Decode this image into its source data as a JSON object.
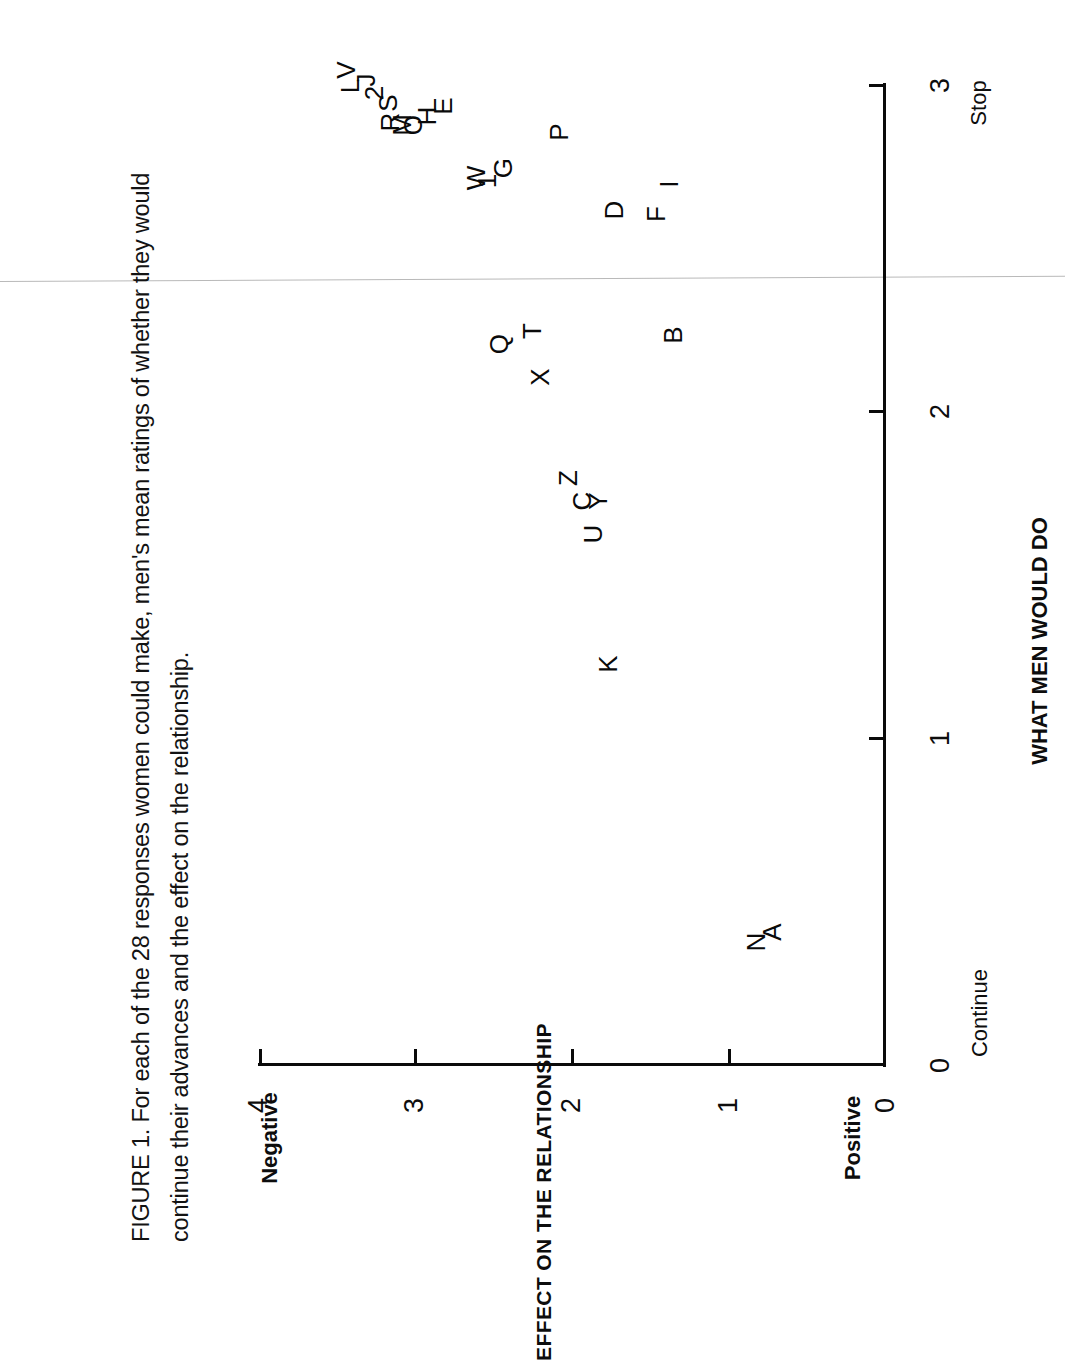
{
  "figure": {
    "caption_line1": "FIGURE 1. For each of the 28 responses women could make, men's mean ratings of whether they would",
    "caption_line2": "continue their advances and the effect on the relationship."
  },
  "chart_data": {
    "type": "scatter",
    "title": "FIGURE 1. For each of the 28 responses women could make, men's mean ratings of whether they would continue their advances and the effect on the relationship.",
    "orientation": "rotated-90-ccw",
    "xlabel": "WHAT MEN WOULD DO",
    "ylabel": "EFFECT ON THE RELATIONSHIP",
    "xlim": [
      0,
      3
    ],
    "ylim": [
      0,
      4
    ],
    "xticks": [
      "0",
      "1",
      "2",
      "3"
    ],
    "yticks": [
      "0",
      "1",
      "2",
      "3",
      "4"
    ],
    "x_low_label": "Continue",
    "x_high_label": "Stop",
    "y_low_label": "Positive",
    "y_high_label": "Negative",
    "grid": false,
    "legend": "none",
    "point_label_field": "label",
    "points": [
      {
        "label": "A",
        "x": 0.4,
        "y": 0.72
      },
      {
        "label": "N",
        "x": 0.37,
        "y": 0.82
      },
      {
        "label": "K",
        "x": 1.22,
        "y": 1.77
      },
      {
        "label": "U",
        "x": 1.62,
        "y": 1.86
      },
      {
        "label": "C",
        "x": 1.72,
        "y": 1.93
      },
      {
        "label": "Y",
        "x": 1.72,
        "y": 1.83
      },
      {
        "label": "Z",
        "x": 1.79,
        "y": 2.02
      },
      {
        "label": "B",
        "x": 2.23,
        "y": 1.35
      },
      {
        "label": "X",
        "x": 2.1,
        "y": 2.2
      },
      {
        "label": "T",
        "x": 2.24,
        "y": 2.25
      },
      {
        "label": "Q",
        "x": 2.2,
        "y": 2.46
      },
      {
        "label": "I",
        "x": 2.69,
        "y": 1.38
      },
      {
        "label": "F",
        "x": 2.6,
        "y": 1.46
      },
      {
        "label": "D",
        "x": 2.61,
        "y": 1.73
      },
      {
        "label": "P",
        "x": 2.85,
        "y": 2.08
      },
      {
        "label": "G",
        "x": 2.74,
        "y": 2.44
      },
      {
        "label": "1",
        "x": 2.7,
        "y": 2.54
      },
      {
        "label": "W",
        "x": 2.71,
        "y": 2.61
      },
      {
        "label": "E",
        "x": 2.93,
        "y": 2.82
      },
      {
        "label": "H",
        "x": 2.9,
        "y": 2.92
      },
      {
        "label": "O",
        "x": 2.87,
        "y": 3.01
      },
      {
        "label": "M",
        "x": 2.87,
        "y": 3.08
      },
      {
        "label": "R",
        "x": 2.88,
        "y": 3.16
      },
      {
        "label": "S",
        "x": 2.94,
        "y": 3.17
      },
      {
        "label": "2",
        "x": 2.97,
        "y": 3.26
      },
      {
        "label": "J",
        "x": 3.01,
        "y": 3.31
      },
      {
        "label": "L",
        "x": 2.99,
        "y": 3.41
      },
      {
        "label": "V",
        "x": 3.04,
        "y": 3.44
      }
    ]
  },
  "axis": {
    "x_ticks": [
      {
        "value": "0",
        "px": 1065
      },
      {
        "value": "1",
        "px": 738
      },
      {
        "value": "2",
        "px": 411
      },
      {
        "value": "3",
        "px": 85
      }
    ],
    "y_ticks": [
      {
        "value": "0",
        "px": 885
      },
      {
        "value": "1",
        "px": 728
      },
      {
        "value": "2",
        "px": 571
      },
      {
        "value": "3",
        "px": 414
      },
      {
        "value": "4",
        "px": 258
      }
    ]
  }
}
